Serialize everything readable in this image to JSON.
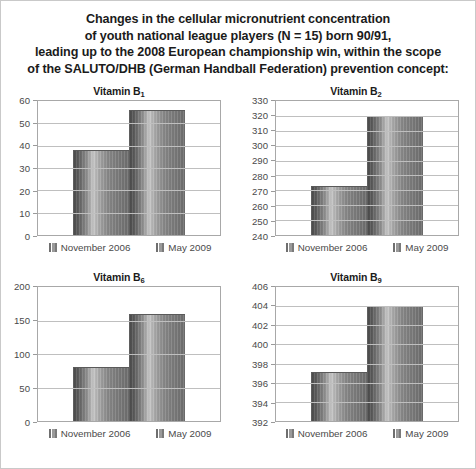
{
  "caption": {
    "lines": [
      "Changes in the cellular micronutrient concentration",
      "of youth national league players (N = 15) born 90/91,",
      "leading up to the 2008 European championship win, within the scope",
      "of the SALUTO/DHB (German Handball Federation) prevention concept:"
    ]
  },
  "legend": {
    "series": [
      "November 2006",
      "May 2009"
    ],
    "swatch_icon": "legend-swatch-icon"
  },
  "colors": {
    "bar_dark": "#4b4b4b",
    "bar_light": "#c9c9c9",
    "bar_mid": "#8a8a8a",
    "gridline": "#bfbfbf",
    "axis": "#a8a8a8",
    "tick_label": "#4a4a4a",
    "title": "#1b1b1b",
    "frame": "#c9c9c9",
    "background": "#ffffff"
  },
  "chart_data": [
    {
      "type": "bar",
      "title": "Vitamin B1",
      "title_base": "Vitamin B",
      "title_sub": "1",
      "categories": [
        "November 2006",
        "May 2009"
      ],
      "values": [
        38,
        56
      ],
      "xlabel": "",
      "ylabel": "",
      "ylim": [
        0,
        60
      ],
      "yticks": [
        0,
        10,
        20,
        30,
        40,
        50,
        60
      ],
      "ytick_labels": [
        "0",
        "10",
        "20",
        "30",
        "40",
        "50",
        "60"
      ],
      "grid": true,
      "legend_position": "bottom"
    },
    {
      "type": "bar",
      "title": "Vitamin B2",
      "title_base": "Vitamin B",
      "title_sub": "2",
      "categories": [
        "November 2006",
        "May 2009"
      ],
      "values": [
        273,
        320
      ],
      "xlabel": "",
      "ylabel": "",
      "ylim": [
        240,
        330
      ],
      "yticks": [
        240,
        250,
        260,
        270,
        280,
        290,
        300,
        310,
        320,
        330
      ],
      "ytick_labels": [
        "240",
        "250",
        "260",
        "270",
        "280",
        "290",
        "300",
        "310",
        "320",
        "330"
      ],
      "grid": true,
      "legend_position": "bottom"
    },
    {
      "type": "bar",
      "title": "Vitamin B6",
      "title_base": "Vitamin B",
      "title_sub": "6",
      "categories": [
        "November 2006",
        "May 2009"
      ],
      "values": [
        80,
        160
      ],
      "xlabel": "",
      "ylabel": "",
      "ylim": [
        0,
        200
      ],
      "yticks": [
        0,
        50,
        100,
        150,
        200
      ],
      "ytick_labels": [
        "0",
        "50",
        "100",
        "150",
        "200"
      ],
      "grid": true,
      "legend_position": "bottom"
    },
    {
      "type": "bar",
      "title": "Vitamin B9",
      "title_base": "Vitamin B",
      "title_sub": "9",
      "categories": [
        "November 2006",
        "May 2009"
      ],
      "values": [
        397.1,
        404
      ],
      "xlabel": "",
      "ylabel": "",
      "ylim": [
        392,
        406
      ],
      "yticks": [
        392,
        394,
        396,
        398,
        400,
        402,
        404,
        406
      ],
      "ytick_labels": [
        "392",
        "394",
        "396",
        "398",
        "400",
        "402",
        "404",
        "406"
      ],
      "grid": true,
      "legend_position": "bottom"
    }
  ]
}
